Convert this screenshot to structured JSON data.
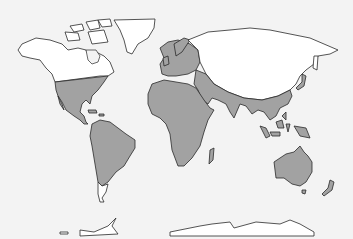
{
  "map": {
    "type": "world-map",
    "projection": "equirectangular-like",
    "background_color": "#f3f3f3",
    "colors": {
      "highlighted_region": "#a2a2a2",
      "other_land": "#ffffff",
      "coastline": "#2a2a2a"
    },
    "regions": [
      {
        "name": "North America (northern)",
        "shade": "white"
      },
      {
        "name": "Greenland",
        "shade": "white"
      },
      {
        "name": "United States & Mexico",
        "shade": "gray"
      },
      {
        "name": "Central America & Caribbean",
        "shade": "gray"
      },
      {
        "name": "South America",
        "shade": "gray"
      },
      {
        "name": "Patagonia",
        "shade": "white"
      },
      {
        "name": "Europe (western/southern)",
        "shade": "gray"
      },
      {
        "name": "Northern Eurasia / Siberia",
        "shade": "white"
      },
      {
        "name": "Africa",
        "shade": "gray"
      },
      {
        "name": "Middle East",
        "shade": "gray"
      },
      {
        "name": "South Asia & Southeast Asia",
        "shade": "gray"
      },
      {
        "name": "Indonesia & Pacific islands",
        "shade": "gray"
      },
      {
        "name": "Australia",
        "shade": "gray"
      },
      {
        "name": "New Zealand",
        "shade": "gray"
      },
      {
        "name": "Antarctica",
        "shade": "white"
      }
    ]
  }
}
